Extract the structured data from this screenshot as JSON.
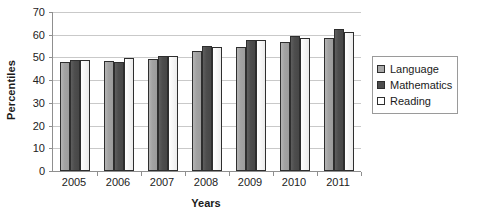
{
  "chart_data": {
    "type": "bar",
    "title": "",
    "xlabel": "Years",
    "ylabel": "Percentiles",
    "categories": [
      "2005",
      "2006",
      "2007",
      "2008",
      "2009",
      "2010",
      "2011"
    ],
    "series": [
      {
        "name": "Language",
        "color": "#a8a8a8",
        "values": [
          47.8,
          48.6,
          49.4,
          53.0,
          54.8,
          56.8,
          58.6
        ]
      },
      {
        "name": "Mathematics",
        "color": "#4d4d4d",
        "values": [
          48.8,
          47.8,
          50.6,
          54.9,
          57.8,
          59.6,
          62.4
        ]
      },
      {
        "name": "Reading",
        "color": "#ffffff",
        "values": [
          48.8,
          49.6,
          50.5,
          54.8,
          57.7,
          58.6,
          61.4
        ]
      }
    ],
    "ylim": [
      0,
      70
    ],
    "ytick_values": [
      0,
      10,
      20,
      30,
      40,
      50,
      60,
      70
    ],
    "ytick_labels": [
      "0",
      "10",
      "20",
      "30",
      "40",
      "50",
      "60",
      "70"
    ],
    "grid": true,
    "legend_position": "right",
    "legend_entries": [
      "Language",
      "Mathematics",
      "Reading"
    ]
  },
  "axes": {
    "y_title": "Percentiles",
    "x_title": "Years"
  }
}
